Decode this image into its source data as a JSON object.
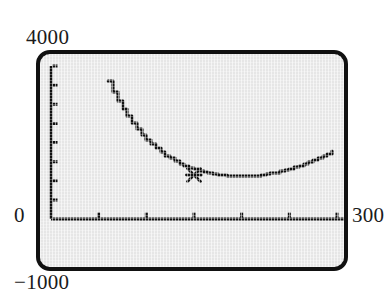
{
  "device": {
    "kind": "graphing-calculator-screen",
    "screen_background": "#e6e6e6",
    "ink_color": "#111111",
    "bezel_color": "#111111"
  },
  "labels": {
    "y_max": "4000",
    "y_min": "−1000",
    "x_min": "0",
    "x_max": "300"
  },
  "cursor": {
    "glyph": "✖",
    "name": "trace-cursor",
    "x_px": 151,
    "y_px": 81
  },
  "chart_data": {
    "type": "line",
    "title": "",
    "xlabel": "",
    "ylabel": "",
    "xlim": [
      0,
      300
    ],
    "ylim": [
      -1000,
      4000
    ],
    "grid": false,
    "legend_position": "none",
    "x_ticks": [
      50,
      100,
      150,
      200,
      250,
      300
    ],
    "y_ticks": [
      500,
      1000,
      1500,
      2000,
      2500,
      3000,
      3500,
      4000
    ],
    "axis_origin": [
      0,
      0
    ],
    "annotations": [
      {
        "label": "minimum-cursor",
        "x": 150,
        "y": 1150,
        "marker": "x"
      }
    ],
    "series": [
      {
        "name": "cost",
        "x": [
          60,
          65,
          70,
          75,
          80,
          85,
          90,
          95,
          100,
          105,
          110,
          115,
          120,
          125,
          130,
          135,
          140,
          145,
          150,
          155,
          160,
          165,
          170,
          175,
          180,
          185,
          190,
          195,
          200,
          205,
          210,
          215,
          220,
          225,
          230,
          235,
          240,
          245,
          250,
          255,
          260,
          265,
          270,
          275,
          280,
          285,
          290,
          295
        ],
        "y": [
          3600,
          3330,
          3090,
          2870,
          2680,
          2500,
          2340,
          2200,
          2070,
          1950,
          1845,
          1750,
          1660,
          1585,
          1510,
          1450,
          1395,
          1345,
          1300,
          1265,
          1230,
          1200,
          1175,
          1155,
          1140,
          1128,
          1120,
          1115,
          1115,
          1118,
          1125,
          1135,
          1150,
          1168,
          1190,
          1215,
          1243,
          1275,
          1310,
          1348,
          1390,
          1435,
          1483,
          1534,
          1588,
          1645,
          1705,
          1768
        ]
      }
    ]
  }
}
